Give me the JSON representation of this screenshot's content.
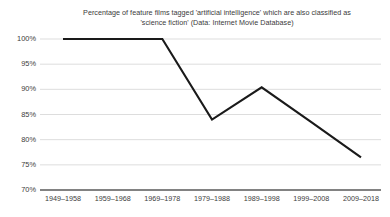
{
  "chart_data": {
    "type": "line",
    "title": "Percentage of feature films tagged 'artificial intelligence' which are also classified as 'science fiction' (Data: Internet Movie Database)",
    "title_lines": [
      "Percentage of feature films tagged 'artificial intelligence' which are also classified as",
      "'science fiction' (Data: Internet Movie Database)"
    ],
    "xlabel": "",
    "ylabel": "",
    "categories": [
      "1949–1958",
      "1959–1968",
      "1969–1978",
      "1979–1988",
      "1989–1998",
      "1999–2008",
      "2009–2018"
    ],
    "values": [
      100,
      100,
      100,
      84,
      90.4,
      83.5,
      76.5
    ],
    "series": [
      {
        "name": "Percentage classified as science fiction",
        "values": [
          100,
          100,
          100,
          84,
          90.4,
          83.5,
          76.5
        ]
      }
    ],
    "ylim": [
      70,
      100
    ],
    "ytick_values": [
      100,
      95,
      90,
      85,
      80,
      75,
      70
    ],
    "ytick_labels": [
      "100%",
      "95%",
      "90%",
      "85%",
      "80%",
      "75%",
      "70%"
    ],
    "grid": true,
    "grid_axis": "y",
    "legend": false,
    "legend_position": "none",
    "markers": false,
    "colors": {
      "line": "#1a1a1a",
      "gridline": "#d9d9d9",
      "axis": "#595959",
      "background": "#ffffff",
      "text": "#3c3c3c"
    }
  }
}
